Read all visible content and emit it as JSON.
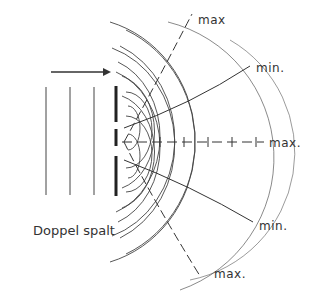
{
  "diagram": {
    "caption": "Doppel spalt",
    "labels": {
      "max_top": "max",
      "min_upper": "min.",
      "max_center": "max.",
      "min_lower": "min.",
      "max_bottom": "max."
    },
    "elements": {
      "incident_arrow": "propagation-direction",
      "plane_wavefronts": 3,
      "double_slit_gaps": 2,
      "wave_arcs_per_slit": 6,
      "interference_lines": [
        "max",
        "min.",
        "max.",
        "min.",
        "max."
      ]
    },
    "colors": {
      "line": "#333333",
      "background": "#ffffff"
    }
  }
}
